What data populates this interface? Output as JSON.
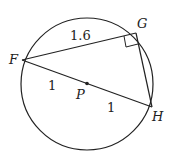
{
  "diagram": {
    "points": {
      "F": "F",
      "G": "G",
      "H": "H",
      "P": "P"
    },
    "segments": {
      "FG": "1.6",
      "FP": "1",
      "PH": "1"
    },
    "stroke_color": "#222222",
    "right_angle_at": "G"
  }
}
